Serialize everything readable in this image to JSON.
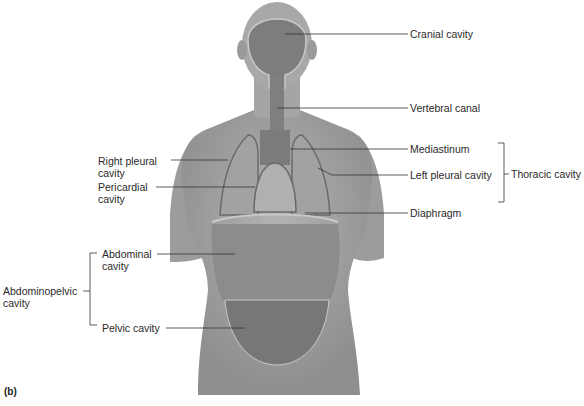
{
  "figure": {
    "panel_label": "(b)",
    "labels": {
      "cranial_cavity": "Cranial cavity",
      "vertebral_canal": "Vertebral canal",
      "mediastinum": "Mediastinum",
      "left_pleural_cavity": "Left pleural cavity",
      "diaphragm": "Diaphragm",
      "thoracic_cavity": "Thoracic cavity",
      "right_pleural_cavity": "Right pleural\ncavity",
      "pericardial_cavity": "Pericardial\ncavity",
      "abdominal_cavity": "Abdominal\ncavity",
      "pelvic_cavity": "Pelvic cavity",
      "abdominopelvic_cavity": "Abdominopelvic\ncavity"
    },
    "colors": {
      "skin": "#a9a9a9",
      "skin_dark": "#8a8a8a",
      "cavity": "#7d7d7d",
      "cavity_outline": "#c8c8c8",
      "leader_line": "#333333"
    }
  }
}
